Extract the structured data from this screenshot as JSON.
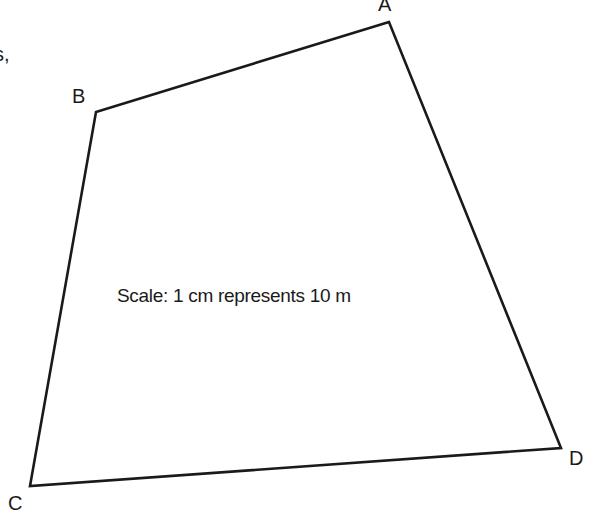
{
  "diagram": {
    "type": "quadrilateral",
    "stray_text": "s,",
    "scale_text": "Scale: 1 cm represents 10 m",
    "vertices": [
      {
        "label": "A",
        "x": 389,
        "y": 22
      },
      {
        "label": "B",
        "x": 96,
        "y": 112
      },
      {
        "label": "C",
        "x": 30,
        "y": 486
      },
      {
        "label": "D",
        "x": 561,
        "y": 448
      }
    ],
    "edges": [
      "AB",
      "BC",
      "CD",
      "DA"
    ],
    "stroke_color": "#1a1a1a"
  }
}
